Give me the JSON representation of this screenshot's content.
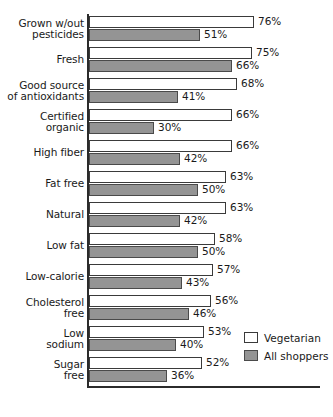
{
  "chart_data": {
    "type": "bar",
    "title": "",
    "subtitle": "",
    "xlabel": "",
    "ylabel": "",
    "orientation": "horizontal",
    "grid": false,
    "xlim": [
      0,
      80
    ],
    "value_suffix": "%",
    "legend_position": "inside-bottom-right",
    "categories": [
      "Grown w/out pesticides",
      "Fresh",
      "Good source of antioxidants",
      "Certified organic",
      "High fiber",
      "Fat free",
      "Natural",
      "Low fat",
      "Low-calorie",
      "Cholesterol free",
      "Low sodium",
      "Sugar free"
    ],
    "category_lines": [
      [
        "Grown w/out",
        "pesticides"
      ],
      [
        "Fresh"
      ],
      [
        "Good source",
        "of antioxidants"
      ],
      [
        "Certified",
        "organic"
      ],
      [
        "High fiber"
      ],
      [
        "Fat free"
      ],
      [
        "Natural"
      ],
      [
        "Low fat"
      ],
      [
        "Low-calorie"
      ],
      [
        "Cholesterol",
        "free"
      ],
      [
        "Low",
        "sodium"
      ],
      [
        "Sugar",
        "free"
      ]
    ],
    "series": [
      {
        "name": "Vegetarian",
        "color": "#ffffff",
        "values": [
          76,
          75,
          68,
          66,
          66,
          63,
          63,
          58,
          57,
          56,
          53,
          52
        ],
        "labels": [
          "76%",
          "75%",
          "68%",
          "66%",
          "66%",
          "63%",
          "63%",
          "58%",
          "57%",
          "56%",
          "53%",
          "52%"
        ]
      },
      {
        "name": "All shoppers",
        "color": "#949494",
        "values": [
          51,
          66,
          41,
          30,
          42,
          50,
          42,
          50,
          43,
          46,
          40,
          36
        ],
        "labels": [
          "51%",
          "66%",
          "41%",
          "30%",
          "42%",
          "50%",
          "42%",
          "50%",
          "43%",
          "46%",
          "40%",
          "36%"
        ]
      }
    ]
  },
  "legend": {
    "items": [
      {
        "label": "Vegetarian",
        "swatch": "veg"
      },
      {
        "label": "All shoppers",
        "swatch": "all"
      }
    ]
  }
}
